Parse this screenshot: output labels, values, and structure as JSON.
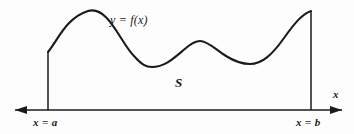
{
  "figure": {
    "background_color": "#fdfdfd",
    "ink_color": "#1a1a1a",
    "labels": {
      "function": "y = f(x)",
      "region": "S",
      "axis_x": "x",
      "left_bound": "x = a",
      "right_bound": "x = b"
    }
  },
  "chart_data": {
    "type": "line",
    "title": "",
    "xlabel": "x",
    "ylabel": "",
    "grid": false,
    "legend": null,
    "annotations": [
      {
        "text": "y = f(x)",
        "x": 110,
        "y": 20,
        "role": "curve-label"
      },
      {
        "text": "S",
        "x": 178,
        "y": 84,
        "role": "region-label"
      },
      {
        "text": "x = a",
        "x": 33,
        "y": 126,
        "role": "left-bound-label"
      },
      {
        "text": "x = b",
        "x": 296,
        "y": 126,
        "role": "right-bound-label"
      },
      {
        "text": "x",
        "x": 336,
        "y": 97,
        "role": "axis-label"
      }
    ],
    "axis": {
      "x_axis_y": 110,
      "x_axis_from": 15,
      "x_axis_to": 342,
      "arrow_left": true,
      "arrow_right": true
    },
    "boundaries": {
      "left": {
        "label": "x = a",
        "x": 48,
        "y_top": 52,
        "y_bottom": 110
      },
      "right": {
        "label": "x = b",
        "x": 311,
        "y_top": 11,
        "y_bottom": 110
      }
    },
    "curve_points": [
      {
        "x": 48,
        "y": 52
      },
      {
        "x": 60,
        "y": 38
      },
      {
        "x": 72,
        "y": 22
      },
      {
        "x": 88,
        "y": 11
      },
      {
        "x": 104,
        "y": 18
      },
      {
        "x": 118,
        "y": 36
      },
      {
        "x": 132,
        "y": 54
      },
      {
        "x": 150,
        "y": 67
      },
      {
        "x": 168,
        "y": 62
      },
      {
        "x": 184,
        "y": 50
      },
      {
        "x": 200,
        "y": 41
      },
      {
        "x": 216,
        "y": 47
      },
      {
        "x": 232,
        "y": 58
      },
      {
        "x": 248,
        "y": 64
      },
      {
        "x": 266,
        "y": 58
      },
      {
        "x": 282,
        "y": 41
      },
      {
        "x": 298,
        "y": 20
      },
      {
        "x": 311,
        "y": 11
      }
    ],
    "curve_path": "M 48 52 C 58 40 66 18 88 11 C 108 5 120 42 134 56 C 142 65 146 67 152 67 C 166 67 176 56 186 48 C 193 42 196 41 200 41 C 208 41 216 50 226 56 C 234 61 241 64 250 64 C 262 64 272 55 284 38 C 294 24 302 14 311 11"
  }
}
